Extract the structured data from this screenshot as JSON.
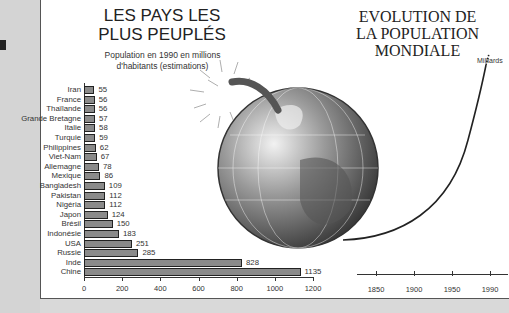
{
  "chart_data": [
    {
      "type": "bar",
      "orientation": "horizontal",
      "title": "LES PAYS LES PLUS PEUPLÉS",
      "subtitle": "Population en 1990 en millions d'habitants (estimations)",
      "categories": [
        "Iran",
        "France",
        "Thaïlande",
        "Grande Bretagne",
        "Italie",
        "Turquie",
        "Philippines",
        "Viet-Nam",
        "Allemagne",
        "Mexique",
        "Bangladesh",
        "Pakistan",
        "Nigéria",
        "Japon",
        "Brésil",
        "Indonésie",
        "USA",
        "Russie",
        "Inde",
        "Chine"
      ],
      "values": [
        55,
        56,
        56,
        57,
        58,
        59,
        62,
        67,
        78,
        86,
        109,
        112,
        112,
        124,
        150,
        183,
        251,
        285,
        828,
        1135
      ],
      "xlabel": "",
      "ylabel": "",
      "xlim": [
        0,
        1200
      ],
      "xticks": [
        0,
        200,
        400,
        600,
        800,
        1000,
        1200
      ],
      "grid": false,
      "bar_color": "#8a8a8a"
    },
    {
      "type": "line",
      "title": "EVOLUTION DE LA POPULATION MONDIALE",
      "ylabel": "Milliards",
      "xticks": [
        1850,
        1900,
        1950,
        1990
      ],
      "x": [
        1810,
        1850,
        1900,
        1950,
        1970,
        1990
      ],
      "values": [
        1.0,
        1.2,
        1.6,
        2.5,
        3.7,
        5.3
      ],
      "grid": false
    }
  ],
  "left": {
    "title_line1": "LES PAYS LES",
    "title_line2": "PLUS PEUPLÉS",
    "subtitle_line1": "Population en 1990 en millions",
    "subtitle_line2": "d'habitants (estimations)",
    "rows": [
      {
        "label": "Iran",
        "value": "55"
      },
      {
        "label": "France",
        "value": "56"
      },
      {
        "label": "Thaïlande",
        "value": "56"
      },
      {
        "label": "Grande Bretagne",
        "value": "57"
      },
      {
        "label": "Italie",
        "value": "58"
      },
      {
        "label": "Turquie",
        "value": "59"
      },
      {
        "label": "Philippines",
        "value": "62"
      },
      {
        "label": "Viet-Nam",
        "value": "67"
      },
      {
        "label": "Allemagne",
        "value": "78"
      },
      {
        "label": "Mexique",
        "value": "86"
      },
      {
        "label": "Bangladesh",
        "value": "109"
      },
      {
        "label": "Pakistan",
        "value": "112"
      },
      {
        "label": "Nigéria",
        "value": "112"
      },
      {
        "label": "Japon",
        "value": "124"
      },
      {
        "label": "Brésil",
        "value": "150"
      },
      {
        "label": "Indonésie",
        "value": "183"
      },
      {
        "label": "USA",
        "value": "251"
      },
      {
        "label": "Russie",
        "value": "285"
      },
      {
        "label": "Inde",
        "value": "828"
      },
      {
        "label": "Chine",
        "value": "1135"
      }
    ],
    "ticks": [
      "0",
      "200",
      "400",
      "600",
      "800",
      "1000",
      "1200"
    ]
  },
  "right": {
    "title_line1": "EVOLUTION DE",
    "title_line2": "LA POPULATION",
    "title_line3": "MONDIALE",
    "unit": "Milliards",
    "ticks": [
      "1850",
      "1900",
      "1950",
      "1990"
    ]
  },
  "illustration": {
    "name": "globe-bomb-icon"
  }
}
